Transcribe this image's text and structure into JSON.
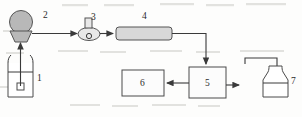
{
  "diagram": {
    "type": "process-flow-schematic",
    "title": "",
    "background_color": "#fdfdfc",
    "line_color": "#3a3a3a",
    "components": [
      {
        "id": "1",
        "label": "1",
        "name": "feed-beaker",
        "shape": "beaker",
        "label_x": 37,
        "label_y": 81
      },
      {
        "id": "2",
        "label": "2",
        "name": "pump",
        "shape": "circle-on-trapezoid",
        "label_x": 43,
        "label_y": 18
      },
      {
        "id": "3",
        "label": "3",
        "name": "valve",
        "shape": "ellipse-with-stem",
        "label_x": 91,
        "label_y": 20
      },
      {
        "id": "4",
        "label": "4",
        "name": "tubular-reactor",
        "shape": "horizontal-tube",
        "label_x": 142,
        "label_y": 19
      },
      {
        "id": "5",
        "label": "5",
        "name": "separator-unit",
        "shape": "rectangle",
        "label_x": 206,
        "label_y": 86
      },
      {
        "id": "6",
        "label": "6",
        "name": "detector-unit",
        "shape": "rectangle",
        "label_x": 142,
        "label_y": 86
      },
      {
        "id": "7",
        "label": "7",
        "name": "collection-flask",
        "shape": "erlenmeyer-flask",
        "label_x": 288,
        "label_y": 84
      }
    ],
    "connections": [
      {
        "name": "beaker-to-pump",
        "from": "1",
        "to": "2",
        "direction": "up"
      },
      {
        "name": "pump-to-valve",
        "from": "2",
        "to": "3",
        "direction": "right"
      },
      {
        "name": "valve-to-reactor",
        "from": "3",
        "to": "4",
        "direction": "right"
      },
      {
        "name": "reactor-to-unit5",
        "from": "4",
        "to": "5",
        "direction": "down"
      },
      {
        "name": "unit5-to-unit6",
        "from": "5",
        "to": "6",
        "direction": "left"
      },
      {
        "name": "unit5-to-flask",
        "from": "5",
        "to": "7",
        "direction": "right"
      }
    ]
  }
}
